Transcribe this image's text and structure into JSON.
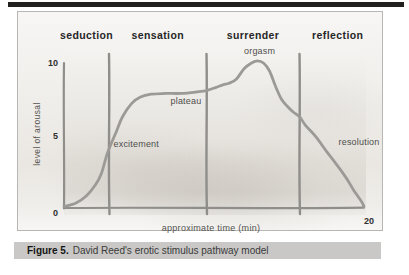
{
  "page": {
    "background": "#ffffff",
    "top_rule_color": "#222120"
  },
  "figure": {
    "caption": {
      "label": "Figure 5.",
      "text": "David Reed's erotic stimulus pathway model",
      "bar_color": "#c9c8c6"
    }
  },
  "chart_data": {
    "type": "line",
    "title": "",
    "xlabel": "approximate time (min)",
    "ylabel": "level of arousal",
    "xlim": [
      0,
      20
    ],
    "ylim": [
      0,
      10
    ],
    "grid": false,
    "legend": "none",
    "line_color": "#9c9a97",
    "divider_color": "#908e8b",
    "phases": [
      "seduction",
      "sensation",
      "surrender",
      "reflection"
    ],
    "phase_boundaries_min": [
      3.0,
      9.5,
      15.7
    ],
    "yticks": [
      {
        "value": 0,
        "label": "0"
      },
      {
        "value": 5,
        "label": "5"
      },
      {
        "value": 10,
        "label": "10"
      }
    ],
    "xticks": [
      {
        "value": 20,
        "label": "20"
      }
    ],
    "annotations": [
      {
        "label": "excitement",
        "x": 3.3,
        "y": 4.4
      },
      {
        "label": "plateau",
        "x": 7.1,
        "y": 7.4
      },
      {
        "label": "orgasm",
        "x": 12.0,
        "y": 10.8
      },
      {
        "label": "resolution",
        "x": 18.3,
        "y": 4.55
      }
    ],
    "series": [
      {
        "name": "arousal pathway",
        "points": [
          [
            0.0,
            0.1
          ],
          [
            0.8,
            0.35
          ],
          [
            1.5,
            0.85
          ],
          [
            2.1,
            1.6
          ],
          [
            2.5,
            2.4
          ],
          [
            2.9,
            3.8
          ],
          [
            3.5,
            5.3
          ],
          [
            3.9,
            6.3
          ],
          [
            4.5,
            7.2
          ],
          [
            5.1,
            7.65
          ],
          [
            5.8,
            7.85
          ],
          [
            6.8,
            7.9
          ],
          [
            7.8,
            7.9
          ],
          [
            8.8,
            8.0
          ],
          [
            9.5,
            8.1
          ],
          [
            10.1,
            8.3
          ],
          [
            10.6,
            8.5
          ],
          [
            11.0,
            8.6
          ],
          [
            11.5,
            8.9
          ],
          [
            12.0,
            9.6
          ],
          [
            12.5,
            10.0
          ],
          [
            12.9,
            10.15
          ],
          [
            13.3,
            10.0
          ],
          [
            13.7,
            9.45
          ],
          [
            14.1,
            8.4
          ],
          [
            14.5,
            7.5
          ],
          [
            14.9,
            7.0
          ],
          [
            15.3,
            6.6
          ],
          [
            15.7,
            6.3
          ],
          [
            16.1,
            5.7
          ],
          [
            16.8,
            4.9
          ],
          [
            17.5,
            3.9
          ],
          [
            18.1,
            3.1
          ],
          [
            18.8,
            2.1
          ],
          [
            19.3,
            1.25
          ],
          [
            19.8,
            0.5
          ],
          [
            20.0,
            0.1
          ]
        ]
      }
    ]
  }
}
